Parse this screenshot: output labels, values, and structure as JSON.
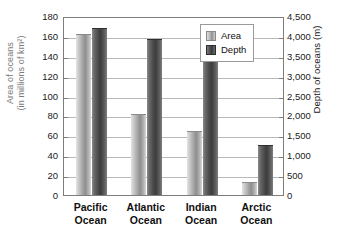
{
  "chart_data": {
    "type": "bar",
    "title": "",
    "categories": [
      "Pacific Ocean",
      "Atlantic Ocean",
      "Indian Ocean",
      "Arctic Ocean"
    ],
    "category_lines": [
      [
        "Pacific",
        "Ocean"
      ],
      [
        "Atlantic",
        "Ocean"
      ],
      [
        "Indian",
        "Ocean"
      ],
      [
        "Arctic",
        "Ocean"
      ]
    ],
    "series": [
      {
        "name": "Area",
        "axis": "left",
        "unit": "millions of km2",
        "values": [
          162,
          81,
          64,
          13
        ],
        "color": "#a3a3a3"
      },
      {
        "name": "Depth",
        "axis": "right",
        "unit": "m",
        "values": [
          4200,
          3900,
          3950,
          1250
        ],
        "color": "#4a4a4a"
      }
    ],
    "depth_values_in_left_units": [
      168,
      157,
      158,
      50
    ],
    "xlabel": "",
    "ylabel": "Area of oceans (in millions of km2)",
    "ylabel_lines": [
      "Area of oceans",
      "(in millions of km²)"
    ],
    "y2label": "Depth of oceans (m)",
    "ylim": [
      0,
      180
    ],
    "y2lim": [
      0,
      4500
    ],
    "yticks": [
      0,
      20,
      40,
      60,
      80,
      100,
      120,
      140,
      160,
      180
    ],
    "ytick_labels": [
      "0",
      "20",
      "40",
      "60",
      "80",
      "100",
      "120",
      "140",
      "160",
      "180"
    ],
    "y2ticks": [
      0,
      500,
      1000,
      1500,
      2000,
      2500,
      3000,
      3500,
      4000,
      4500
    ],
    "y2tick_labels": [
      "0",
      "500",
      "1,000",
      "1,500",
      "2,000",
      "2,500",
      "3,000",
      "3,500",
      "4,000",
      "4,500"
    ],
    "grid": true,
    "legend": {
      "position": "top-right",
      "entries": [
        {
          "label": "Area",
          "color": "#a3a3a3"
        },
        {
          "label": "Depth",
          "color": "#4a4a4a"
        }
      ]
    }
  }
}
